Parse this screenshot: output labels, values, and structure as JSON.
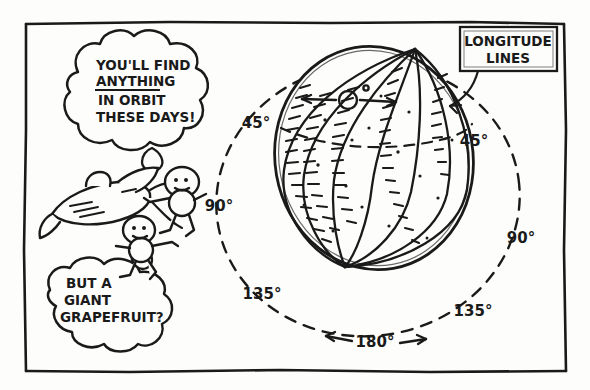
{
  "panel": {
    "name": "cartoon-panel",
    "border_color": "#1a1a1a",
    "background": "#fdfdfb"
  },
  "speech_bubbles": [
    {
      "id": "upper-thought-bubble",
      "lines": [
        "YOU'LL FIND",
        "ANYTHING",
        "IN ORBIT",
        "THESE DAYS!"
      ],
      "underlined_line": "ANYTHING",
      "speaker": "upper-astronaut"
    },
    {
      "id": "lower-thought-bubble",
      "lines": [
        "BUT A",
        "GIANT",
        "GRAPEFRUIT?"
      ],
      "underlined_line": "",
      "speaker": "lower-astronaut"
    }
  ],
  "callout": {
    "label_lines": [
      "LONGITUDE",
      "LINES"
    ],
    "points_to": "longitude-lines-on-globe"
  },
  "globe": {
    "label": "globe-sphere",
    "description": "hand-drawn beach-ball style globe with stippled longitude gores",
    "longitude_gore_count": 8,
    "origin_marker": "0-degree-reference-circle"
  },
  "orbit": {
    "label": "dashed-orbit-circle",
    "style": "dashed",
    "arrows": [
      "left",
      "right"
    ]
  },
  "angle_labels": [
    {
      "id": "angle-45-left",
      "text": "45°",
      "x": 256,
      "y": 128
    },
    {
      "id": "angle-90-left",
      "text": "90°",
      "x": 219,
      "y": 211
    },
    {
      "id": "angle-135-left",
      "text": "135°",
      "x": 262,
      "y": 299
    },
    {
      "id": "angle-180-bottom",
      "text": "180°",
      "x": 375,
      "y": 345
    },
    {
      "id": "angle-135-right",
      "text": "135°",
      "x": 473,
      "y": 316
    },
    {
      "id": "angle-90-right",
      "text": "90°",
      "x": 521,
      "y": 243
    },
    {
      "id": "angle-45-right",
      "text": "45°",
      "x": 474,
      "y": 146
    }
  ],
  "figures": [
    {
      "id": "rocket",
      "label": "cartoon-rocket-ship"
    },
    {
      "id": "astronaut-upper",
      "label": "floating-astronaut-upper"
    },
    {
      "id": "astronaut-lower",
      "label": "floating-astronaut-lower"
    }
  ],
  "colors": {
    "ink": "#1a1a1a",
    "paper": "#fdfdfb"
  }
}
